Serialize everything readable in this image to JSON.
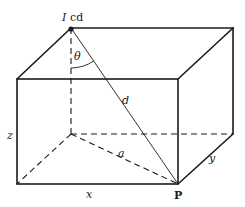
{
  "diagram": {
    "labels": {
      "source_intensity_symbol": "I",
      "source_unit": "cd",
      "angle": "θ",
      "distance": "d",
      "floor_diagonal": "a",
      "height": "z",
      "length": "x",
      "width": "y",
      "point": "P"
    },
    "colors": {
      "line": "#1a1a1a",
      "background": "#ffffff"
    }
  }
}
